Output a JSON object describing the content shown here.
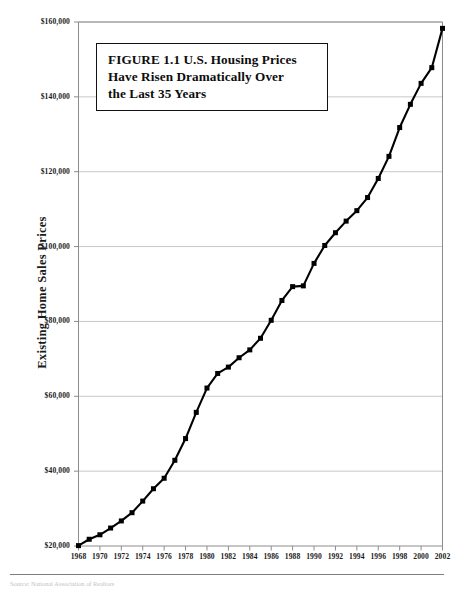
{
  "figure": {
    "title_line_1": "FIGURE 1.1  U.S. Housing Prices",
    "title_line_2": "Have Risen Dramatically Over",
    "title_line_3": "the Last 35 Years",
    "title_full": "FIGURE 1.1  U.S. Housing Prices Have Risen Dramatically Over the Last 35 Years",
    "source_note": "Source: National Association of Realtors"
  },
  "colors": {
    "line": "#000000",
    "marker": "#000000",
    "gridline": "#c8c8c8",
    "axis": "#8c8c8c",
    "background": "#ffffff",
    "title_box_border": "#111111",
    "text": "#1a1a1a"
  },
  "chart_data": {
    "type": "line",
    "title": "FIGURE 1.1  U.S. Housing Prices Have Risen Dramatically Over the Last 35 Years",
    "xlabel": "",
    "ylabel": "Existing Home Sales Prices",
    "xlim": [
      1968,
      2002
    ],
    "ylim": [
      20000,
      160000
    ],
    "grid": true,
    "legend": false,
    "marker": "square",
    "y_tick_labels": [
      "$20,000",
      "$40,000",
      "$60,000",
      "$80,000",
      "$100,000",
      "$120,000",
      "$140,000",
      "$160,000"
    ],
    "y_ticks": [
      20000,
      40000,
      60000,
      80000,
      100000,
      120000,
      140000,
      160000
    ],
    "x_tick_labels": [
      "1968",
      "1970",
      "1972",
      "1974",
      "1976",
      "1978",
      "1980",
      "1982",
      "1984",
      "1986",
      "1988",
      "1990",
      "1992",
      "1994",
      "1996",
      "1998",
      "2000",
      "2002"
    ],
    "x_ticks": [
      1968,
      1970,
      1972,
      1974,
      1976,
      1978,
      1980,
      1982,
      1984,
      1986,
      1988,
      1990,
      1992,
      1994,
      1996,
      1998,
      2000,
      2002
    ],
    "x": [
      1968,
      1969,
      1970,
      1971,
      1972,
      1973,
      1974,
      1975,
      1976,
      1977,
      1978,
      1979,
      1980,
      1981,
      1982,
      1983,
      1984,
      1985,
      1986,
      1987,
      1988,
      1989,
      1990,
      1991,
      1992,
      1993,
      1994,
      1995,
      1996,
      1997,
      1998,
      1999,
      2000,
      2001,
      2002
    ],
    "values": [
      20100,
      21800,
      23000,
      24800,
      26700,
      28900,
      32000,
      35300,
      38100,
      42900,
      48700,
      55700,
      62200,
      66100,
      67800,
      70300,
      72400,
      75500,
      80300,
      85600,
      89300,
      89500,
      95500,
      100300,
      103700,
      106800,
      109600,
      113100,
      118200,
      124100,
      131800,
      138000,
      143600,
      147800,
      158300
    ],
    "series": [
      {
        "name": "Existing Home Sales Prices",
        "values": [
          20100,
          21800,
          23000,
          24800,
          26700,
          28900,
          32000,
          35300,
          38100,
          42900,
          48700,
          55700,
          62200,
          66100,
          67800,
          70300,
          72400,
          75500,
          80300,
          85600,
          89300,
          89500,
          95500,
          100300,
          103700,
          106800,
          109600,
          113100,
          118200,
          124100,
          131800,
          138000,
          143600,
          147800,
          158300
        ]
      }
    ]
  }
}
